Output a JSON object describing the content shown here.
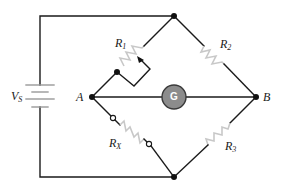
{
  "diagram": {
    "type": "Wheatstone bridge circuit",
    "source": {
      "symbol": "V",
      "subscript": "S"
    },
    "nodes": [
      {
        "label": "A"
      },
      {
        "label": "B"
      }
    ],
    "resistors": [
      {
        "symbol": "R",
        "subscript": "1",
        "variable": true
      },
      {
        "symbol": "R",
        "subscript": "2"
      },
      {
        "symbol": "R",
        "subscript": "3"
      },
      {
        "symbol": "R",
        "subscript": "X",
        "unknown": true
      }
    ],
    "galvanometer": {
      "label": "G"
    },
    "colors": {
      "wire": "#1a1a1a",
      "resistor": "#c8c8c8",
      "galvanometer_fill": "#8c8c8c"
    }
  }
}
